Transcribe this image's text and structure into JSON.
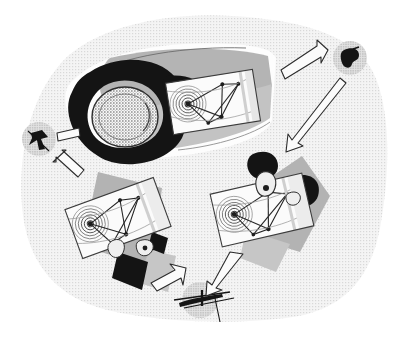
{
  "figure": {
    "title": "",
    "caption": "",
    "canvas": {
      "width": 404,
      "height": 342
    },
    "background": {
      "page_color": "#ffffff",
      "blob_color": "#f1f1f1",
      "blob_texture": "halftone-dots",
      "blob_name": "background-blob"
    },
    "palette": {
      "black": "#111111",
      "dark_ink": "#1a1a1a",
      "mid_gray": "#a8a8a8",
      "light_gray": "#d4d4d4",
      "pale_gray": "#ededed",
      "card_white": "#fbfbfb",
      "outline": "#2b2b2b"
    }
  },
  "scene": {
    "main_object": {
      "name": "central-ring-object",
      "label": "",
      "parts": {
        "plate_label": "",
        "ring_label": "",
        "stippled_oval_label": "",
        "spiral_card_label": ""
      }
    },
    "cards": [
      {
        "name": "card-main",
        "label": "",
        "rotation_deg": -9,
        "spiral_rings": 6,
        "node_count": 6
      },
      {
        "name": "card-lower-left",
        "label": "",
        "rotation_deg": -20,
        "spiral_rings": 6,
        "node_count": 6
      },
      {
        "name": "card-lower-right",
        "label": "",
        "rotation_deg": -13,
        "spiral_rings": 6,
        "node_count": 6
      }
    ],
    "nodes": [
      {
        "name": "node-left",
        "label": "",
        "shape": "star-blob",
        "texture": "halftone-dots"
      },
      {
        "name": "node-top-right",
        "label": "",
        "shape": "irregular-blob",
        "texture": "halftone-dots"
      },
      {
        "name": "node-bottom",
        "label": "",
        "shape": "streak-blob",
        "texture": "halftone-dots"
      }
    ],
    "arrows": [
      {
        "name": "arrow-to-left-node",
        "label": "",
        "direction": "up-left"
      },
      {
        "name": "arrow-stub-left",
        "label": "",
        "direction": "left"
      },
      {
        "name": "arrow-to-top-right-node",
        "label": "",
        "direction": "up-right"
      },
      {
        "name": "arrow-from-top-right-node",
        "label": "",
        "direction": "down-left"
      },
      {
        "name": "arrow-to-lower-left-card",
        "label": "",
        "direction": "up-left"
      },
      {
        "name": "arrow-to-bottom-node",
        "label": "",
        "direction": "down-left"
      }
    ]
  }
}
